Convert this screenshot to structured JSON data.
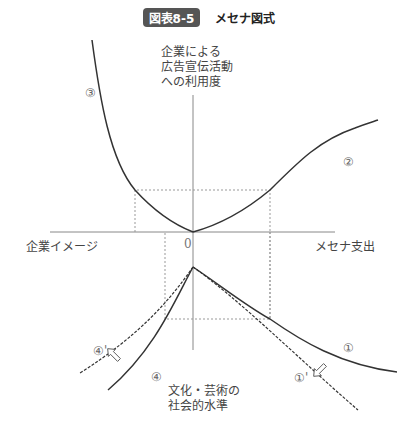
{
  "title": {
    "badge": "図表8-5",
    "text": "メセナ図式"
  },
  "axes": {
    "y_top_label": [
      "企業による",
      "広告宣伝活動",
      "への利用度"
    ],
    "x_left_label": "企業イメージ",
    "x_right_label": "メセナ支出",
    "y_bottom_label": [
      "文化・芸術の",
      "社会的水準"
    ],
    "origin": "0"
  },
  "curve_labels": {
    "c1": "①",
    "c1p": "①'",
    "c2": "②",
    "c3": "③",
    "c4": "④",
    "c4p": "④'"
  },
  "colors": {
    "line": "#333333",
    "axis": "#888888",
    "dotted": "#999999",
    "badge_bg": "#555555"
  }
}
